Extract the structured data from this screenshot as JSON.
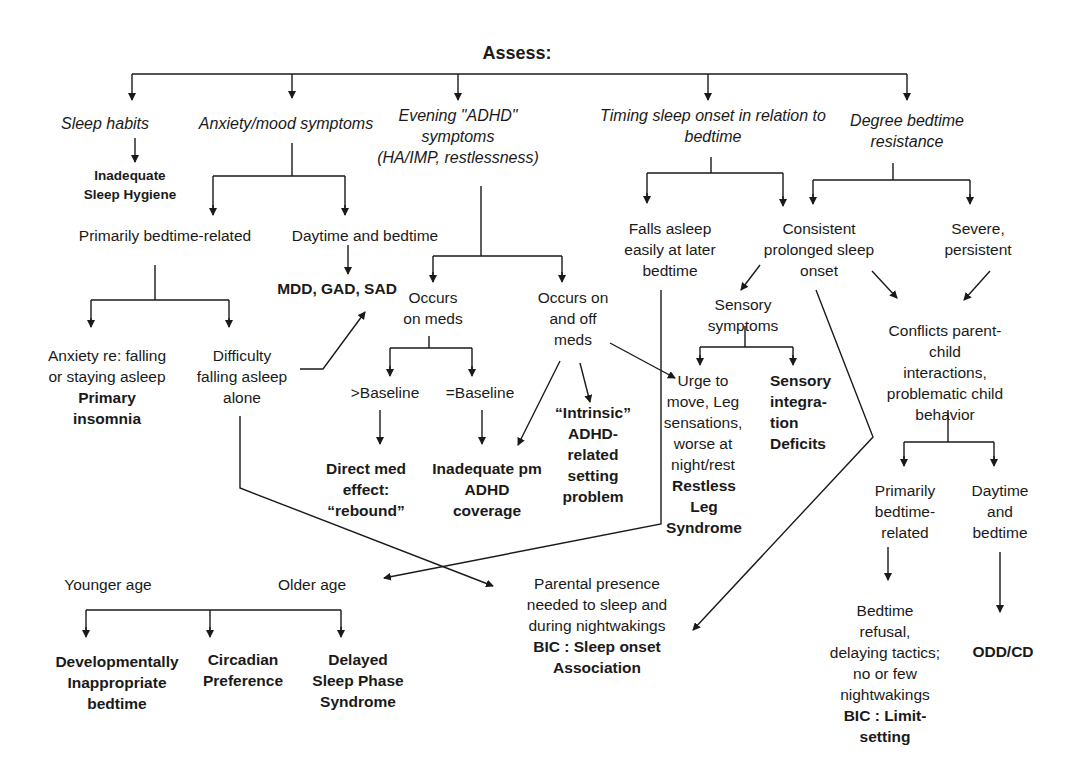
{
  "title": "Assess:",
  "nodes": {
    "sleep_habits": "Sleep habits",
    "anxiety_mood": "Anxiety/mood symptoms",
    "evening_adhd": "Evening \"ADHD\"\nsymptoms\n(HA/IMP, restlessness)",
    "timing_onset": "Timing sleep onset in relation to\nbedtime",
    "degree_resistance": "Degree bedtime\nresistance",
    "inadequate_hygiene": "Inadequate\nSleep Hygiene",
    "primarily_bedtime": "Primarily bedtime-related",
    "daytime_bedtime": "Daytime and bedtime",
    "mdd_gad_sad": "MDD, GAD, SAD",
    "anxiety_falling": "Anxiety re: falling\nor staying asleep",
    "primary_insomnia": "Primary\ninsomnia",
    "difficulty_alone": "Difficulty\nfalling asleep\nalone",
    "occurs_on_meds": "Occurs\non meds",
    "occurs_on_off": "Occurs on\nand off\nmeds",
    "gt_baseline": ">Baseline",
    "eq_baseline": "=Baseline",
    "direct_med": "Direct med\neffect:\n“rebound”",
    "inadequate_pm": "Inadequate pm\nADHD\ncoverage",
    "intrinsic_adhd": "“Intrinsic”\nADHD-\nrelated\nsetting\nproblem",
    "falls_asleep_later": "Falls asleep\neasily at later\nbedtime",
    "consistent_prolonged": "Consistent\nprolonged sleep\nonset",
    "severe_persistent": "Severe,\npersistent",
    "sensory_symptoms": "Sensory\nsymptoms",
    "urge_to_move": "Urge to\nmove, Leg\nsensations,\nworse at\nnight/rest",
    "restless_leg": "Restless\nLeg\nSyndrome",
    "sensory_integration": "Sensory\nintegra-\ntion\nDeficits",
    "conflicts": "Conflicts parent-child\ninteractions,\nproblematic child\nbehavior",
    "primarily_bedtime_related_2": "Primarily\nbedtime-\nrelated",
    "daytime_and_bedtime_2": "Daytime\nand\nbedtime",
    "bedtime_refusal": "Bedtime\nrefusal,\ndelaying tactics;\nno or few\nnightwakings",
    "bic_limit": "BIC : Limit-\nsetting",
    "odd_cd": "ODD/CD",
    "younger_age": "Younger age",
    "older_age": "Older age",
    "parental_presence": "Parental presence\nneeded to sleep and\nduring nightwakings",
    "bic_sleep_onset": "BIC : Sleep onset\nAssociation",
    "developmentally": "Developmentally\nInappropriate\nbedtime",
    "circadian": "Circadian\nPreference",
    "delayed_phase": "Delayed\nSleep Phase\nSyndrome"
  }
}
